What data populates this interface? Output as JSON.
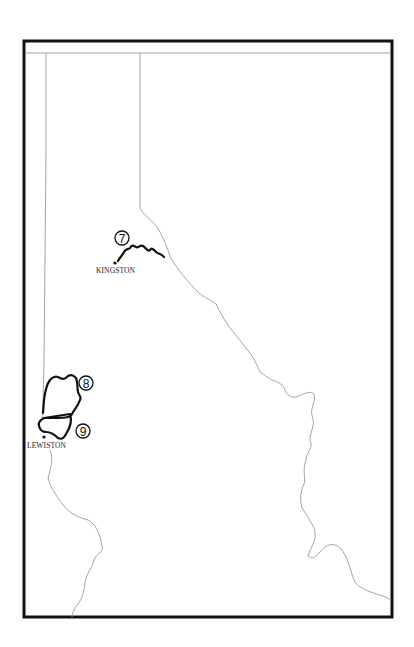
{
  "map": {
    "type": "outline route map",
    "frame": {
      "x": 24,
      "y": 41,
      "width": 368,
      "height": 576,
      "stroke": "#111111"
    },
    "border_color": "#9a9a9a",
    "route_color": "#111111",
    "cities": [
      {
        "id": "kingston",
        "label": "KINGSTON",
        "dot": [
          115,
          263
        ],
        "label_pos": [
          96,
          273
        ]
      },
      {
        "id": "lewiston",
        "label": "LEWISTON",
        "dot": [
          44,
          437
        ],
        "label_pos": [
          27,
          448
        ]
      }
    ],
    "markers": [
      {
        "id": "route-7",
        "number": "7",
        "center": [
          122,
          238
        ]
      },
      {
        "id": "route-8",
        "number": "8",
        "center": [
          86,
          383
        ]
      },
      {
        "id": "route-9",
        "number": "9",
        "center": [
          83,
          431
        ]
      }
    ]
  }
}
